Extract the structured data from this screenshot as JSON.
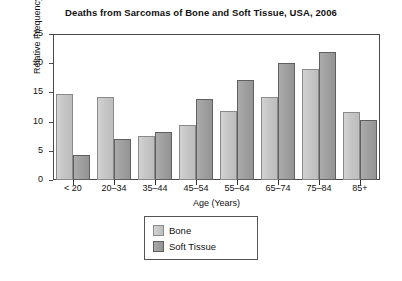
{
  "chart_data": {
    "type": "bar",
    "title": "Deaths from Sarcomas of Bone and Soft Tissue, USA, 2006",
    "xlabel": "Age (Years)",
    "ylabel": "Relative Frequency (%)",
    "categories": [
      "< 20",
      "20–34",
      "35–44",
      "45–54",
      "55–64",
      "65–74",
      "75–84",
      "85+"
    ],
    "yticks": [
      0,
      5,
      10,
      15,
      20,
      25
    ],
    "ylim": [
      0,
      25
    ],
    "grid": false,
    "legend_position": "bottom-center",
    "series": [
      {
        "name": "Bone",
        "color": "#c6c6c6",
        "values": [
          14.8,
          14.2,
          7.5,
          9.4,
          11.9,
          14.2,
          19.0,
          11.6
        ]
      },
      {
        "name": "Soft Tissue",
        "color": "#a0a0a0",
        "values": [
          4.3,
          7.0,
          8.3,
          13.8,
          17.2,
          20.0,
          22.0,
          10.2
        ]
      }
    ]
  }
}
